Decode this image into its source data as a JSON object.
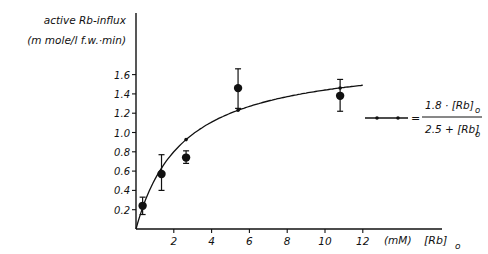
{
  "chart_data": {
    "type": "scatter",
    "title": "",
    "ylabel_line1": "active Rb-influx",
    "ylabel_line2": "(m mole/l f.w.·min)",
    "xlabel_unit": "(mM)",
    "xlabel_var": "[Rb]",
    "xlabel_sub": "o",
    "xlim": [
      0,
      14
    ],
    "ylim": [
      0,
      1.8
    ],
    "xticks": [
      2,
      4,
      6,
      8,
      10,
      12
    ],
    "xtick_labels": [
      "2",
      "4",
      "6",
      "8",
      "10",
      "12"
    ],
    "yticks": [
      0.2,
      0.4,
      0.6,
      0.8,
      1.0,
      1.2,
      1.4,
      1.6
    ],
    "ytick_labels": [
      "0.2",
      "0.4",
      "0.6",
      "0.8",
      "1.0",
      "1.2",
      "1.4",
      "1.6"
    ],
    "grid": false,
    "series": [
      {
        "name": "measured",
        "marker": "filled-circle",
        "x": [
          0.35,
          1.35,
          2.65,
          5.4,
          10.8
        ],
        "y": [
          0.24,
          0.57,
          0.74,
          1.46,
          1.38
        ],
        "yerr_low": [
          0.15,
          0.4,
          0.68,
          1.25,
          1.22
        ],
        "yerr_high": [
          0.33,
          0.77,
          0.81,
          1.66,
          1.55
        ]
      },
      {
        "name": "fit",
        "type": "line",
        "equation": "v = 1.8·[Rb]o / (2.5 + [Rb]o)",
        "vmax": 1.8,
        "km": 2.5,
        "x_range": [
          0,
          12
        ],
        "marker_points_x": [
          0.35,
          2.65,
          5.4,
          10.8
        ]
      }
    ],
    "legend": {
      "position": "right",
      "numerator": "1.8 · [Rb]",
      "numerator_sub": "o",
      "denominator": "2.5 + [Rb]",
      "denominator_sub": "o",
      "equals": "="
    }
  }
}
